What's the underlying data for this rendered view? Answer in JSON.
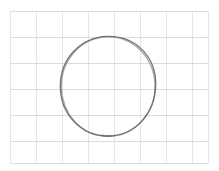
{
  "canvas": {
    "width": 219,
    "height": 171,
    "background_color": "#ffffff",
    "title": "Hand-drawn circle on graph paper"
  },
  "grid": {
    "label": "graph-paper-grid",
    "line_color": "#e6e6e6",
    "line_color_strong": "#dcdcdc",
    "line_width": 1,
    "cell_size": 26,
    "origin_x": 10,
    "origin_y": 11,
    "extent_x": 208,
    "extent_y": 163,
    "vertical_positions": [
      10,
      36,
      62,
      88,
      114,
      140,
      166,
      192,
      208
    ],
    "horizontal_positions": [
      11,
      37,
      63,
      89,
      115,
      141,
      163
    ],
    "visible": true
  },
  "drawing": {
    "label": "hand-drawn-circle",
    "shape_type": "circle",
    "stroke_color": "#6e6e6e",
    "stroke_color_light": "#9a9a9a",
    "stroke_width": 1.3,
    "center_x": 108,
    "center_y": 86,
    "radius_x": 48,
    "radius_y": 50,
    "bounds": {
      "left": 60,
      "top": 36,
      "right": 156,
      "bottom": 136
    },
    "style": "sketch",
    "passes": 2,
    "closure_point": "bottom",
    "paths": {
      "primary": "M 108 36.3 C 121.5 36.0 134.0 41.2 142.6 50.1 C 151.2 59.0 155.9 71.5 155.7 84.5 C 155.5 97.6 151.0 110.6 142.7 120.1 C 134.4 129.6 122.0 135.6 109.0 136.0 C 95.8 136.4 82.9 130.9 74.0 121.5 C 65.0 112.1 60.3 99.2 60.3 86.2 C 60.3 73.1 65.2 60.2 74.0 51.0 C 82.8 41.8 95.0 36.6 108 36.3 Z",
      "secondary": "M 107.4 36.6 C 94.2 37.4 82.4 43.0 74.2 52.2 C 66.0 61.4 61.2 74.0 61.4 86.8 C 61.6 99.7 66.3 112.3 74.6 121.4 C 82.9 130.5 94.8 136.2 107.6 136.3 C 120.6 136.4 133.2 130.6 141.8 121.2 C 150.4 111.8 155.2 98.8 155.0 85.7 C 154.8 72.7 149.8 60.0 141.2 51.0 C 132.6 42.0 120.3 36.7 107.4 36.6 Z",
      "closure_tail": "M 101.5 135.2 C 104.6 135.9 108.0 136.2 111.3 136.0"
    }
  }
}
